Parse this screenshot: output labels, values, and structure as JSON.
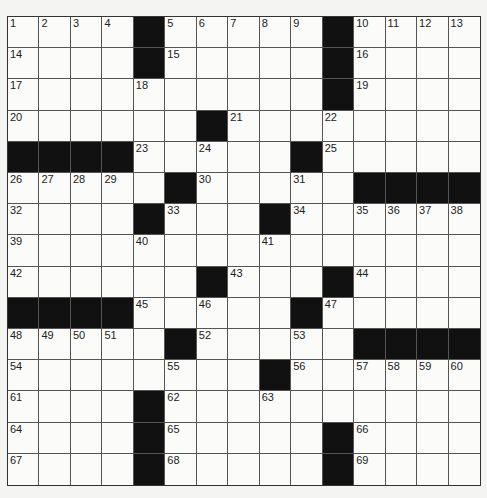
{
  "puzzle": {
    "type": "crossword",
    "rows": 15,
    "cols": 15,
    "grid": [
      "....#.....#....",
      "....#.....#....",
      "..........#....",
      "......#........",
      "####.....#.....",
      ".....#.....####",
      "....#...#......",
      "...............",
      "......#...#....",
      "####.....#.....",
      ".....#.....####",
      "........#......",
      "....#..........",
      "....#.....#....",
      "....#.....#...."
    ],
    "numbers": [
      [
        1,
        2,
        3,
        4,
        0,
        5,
        6,
        7,
        8,
        9,
        0,
        10,
        11,
        12,
        13
      ],
      [
        14,
        0,
        0,
        0,
        0,
        15,
        0,
        0,
        0,
        0,
        0,
        16,
        0,
        0,
        0
      ],
      [
        17,
        0,
        0,
        0,
        18,
        0,
        0,
        0,
        0,
        0,
        0,
        19,
        0,
        0,
        0
      ],
      [
        20,
        0,
        0,
        0,
        0,
        0,
        0,
        21,
        0,
        0,
        22,
        0,
        0,
        0,
        0
      ],
      [
        0,
        0,
        0,
        0,
        23,
        0,
        24,
        0,
        0,
        0,
        25,
        0,
        0,
        0,
        0
      ],
      [
        26,
        27,
        28,
        29,
        0,
        0,
        30,
        0,
        0,
        31,
        0,
        0,
        0,
        0,
        0
      ],
      [
        32,
        0,
        0,
        0,
        0,
        33,
        0,
        0,
        0,
        34,
        0,
        35,
        36,
        37,
        38
      ],
      [
        39,
        0,
        0,
        0,
        40,
        0,
        0,
        0,
        41,
        0,
        0,
        0,
        0,
        0,
        0
      ],
      [
        42,
        0,
        0,
        0,
        0,
        0,
        0,
        43,
        0,
        0,
        0,
        44,
        0,
        0,
        0
      ],
      [
        0,
        0,
        0,
        0,
        45,
        0,
        46,
        0,
        0,
        0,
        47,
        0,
        0,
        0,
        0
      ],
      [
        48,
        49,
        50,
        51,
        0,
        0,
        52,
        0,
        0,
        53,
        0,
        0,
        0,
        0,
        0
      ],
      [
        54,
        0,
        0,
        0,
        0,
        55,
        0,
        0,
        0,
        56,
        0,
        57,
        58,
        59,
        60
      ],
      [
        61,
        0,
        0,
        0,
        0,
        62,
        0,
        0,
        63,
        0,
        0,
        0,
        0,
        0,
        0
      ],
      [
        64,
        0,
        0,
        0,
        0,
        65,
        0,
        0,
        0,
        0,
        0,
        66,
        0,
        0,
        0
      ],
      [
        67,
        0,
        0,
        0,
        0,
        68,
        0,
        0,
        0,
        0,
        0,
        69,
        0,
        0,
        0
      ]
    ],
    "entries": []
  },
  "colors": {
    "block": "#111111",
    "cell": "#fbfbf9",
    "line": "#555555"
  }
}
